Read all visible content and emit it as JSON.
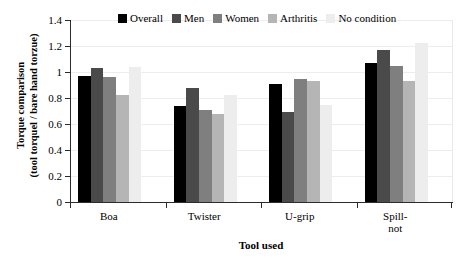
{
  "chart_data": {
    "type": "bar",
    "title": "",
    "xlabel": "Tool used",
    "ylabel_line1": "Torque comparison",
    "ylabel_line2": "(tool torquel / bare hand torzue)",
    "categories": [
      "Boa",
      "Twister",
      "U-grip",
      "Spill-\nnot"
    ],
    "category_labels": [
      {
        "line1": "Boa",
        "line2": ""
      },
      {
        "line1": "Twister",
        "line2": ""
      },
      {
        "line1": "U-grip",
        "line2": ""
      },
      {
        "line1": "Spill-",
        "line2": "not"
      }
    ],
    "series": [
      {
        "name": "Overall",
        "color": "#000000",
        "values": [
          0.97,
          0.74,
          0.91,
          1.07
        ]
      },
      {
        "name": "Men",
        "color": "#4a4a4a",
        "values": [
          1.03,
          0.88,
          0.69,
          1.17
        ]
      },
      {
        "name": "Women",
        "color": "#7f7f7f",
        "values": [
          0.96,
          0.71,
          0.95,
          1.05
        ]
      },
      {
        "name": "Arthritis",
        "color": "#b5b5b5",
        "values": [
          0.82,
          0.68,
          0.93,
          0.93
        ]
      },
      {
        "name": "No condition",
        "color": "#ededed",
        "values": [
          1.04,
          0.82,
          0.75,
          1.22
        ]
      }
    ],
    "ylim": [
      0,
      1.4
    ],
    "yticks": [
      0,
      0.2,
      0.4,
      0.6,
      0.8,
      1,
      1.2,
      1.4
    ],
    "ytick_labels": [
      "0",
      "0.2",
      "0.4",
      "0.6",
      "0.8",
      "1",
      "1.2",
      "1.4"
    ],
    "grid": true,
    "legend_position": "top-center",
    "legend_entries": [
      "Overall",
      "Men",
      "Women",
      "Arthritis",
      "No condition"
    ]
  }
}
